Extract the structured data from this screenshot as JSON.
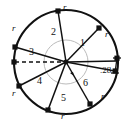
{
  "figure": {
    "colors": {
      "stroke": "#111111",
      "inner_arc": "#b3b3b3",
      "vertex": "#111111",
      "background": "#ffffff"
    },
    "outer_circle": {
      "cx": 66,
      "cy": 62,
      "r": 52
    },
    "inner_arc": {
      "cx": 66,
      "cy": 62,
      "r": 22
    },
    "center_point": {
      "cx": 66,
      "cy": 62
    },
    "chord_labels": [
      {
        "text": "r",
        "x": 63,
        "y": 3
      },
      {
        "text": "r",
        "x": 105,
        "y": 30
      },
      {
        "text": "r",
        "x": 101,
        "y": 92
      },
      {
        "text": "r",
        "x": 61,
        "y": 112
      },
      {
        "text": "r",
        "x": 12,
        "y": 89
      },
      {
        "text": "r",
        "x": 12,
        "y": 24
      },
      {
        "text": "r",
        "x": 112,
        "y": 60
      }
    ],
    "sector_labels": [
      {
        "text": "1",
        "x": 80,
        "y": 38
      },
      {
        "text": "2",
        "x": 51,
        "y": 27
      },
      {
        "text": "3",
        "x": 29,
        "y": 47
      },
      {
        "text": "4",
        "x": 37,
        "y": 76
      },
      {
        "text": "5",
        "x": 61,
        "y": 93
      },
      {
        "text": "6",
        "x": 83,
        "y": 78
      }
    ],
    "measurement": {
      "value": ".28",
      "unit": "r",
      "full_text": ".28 r",
      "x": 100,
      "y": 70
    },
    "vertices": [
      {
        "name": "vertex-top",
        "x": 58,
        "y": 11
      },
      {
        "name": "vertex-upper-right",
        "x": 99,
        "y": 28
      },
      {
        "name": "vertex-right",
        "x": 115,
        "y": 70
      },
      {
        "name": "vertex-right-tick",
        "x": 117,
        "y": 61
      },
      {
        "name": "vertex-lower-right",
        "x": 90,
        "y": 104
      },
      {
        "name": "vertex-bottom",
        "x": 48,
        "y": 110
      },
      {
        "name": "vertex-lower-left",
        "x": 19,
        "y": 86
      },
      {
        "name": "vertex-left",
        "x": 15,
        "y": 47
      },
      {
        "name": "vertex-left-dashed",
        "x": 14,
        "y": 62
      }
    ],
    "dashed_line": {
      "name": "reference-dashed-radius",
      "x1": 15,
      "y1": 62,
      "x2": 66,
      "y2": 62
    },
    "angle_marker": {
      "name": "central-angle-arrow",
      "x": 72,
      "y": 74
    }
  }
}
